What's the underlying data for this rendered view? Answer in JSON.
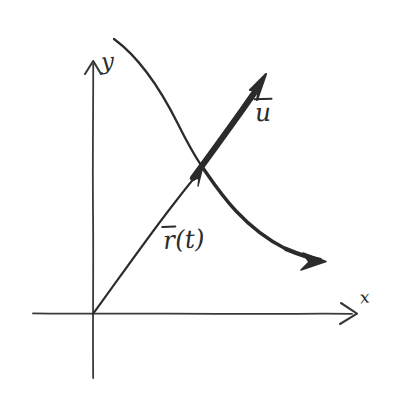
{
  "figure": {
    "kind": "hand-drawn-sketch",
    "background_color": "#ffffff",
    "ink_color": "#2b2b2b",
    "width": 395,
    "height": 402
  },
  "axes": {
    "x_label": "x",
    "y_label": "y",
    "origin": {
      "x": 93,
      "y": 314
    },
    "x_axis": {
      "start_x": 33,
      "end_x": 356,
      "y": 314,
      "arrow": "right"
    },
    "y_axis": {
      "x": 93,
      "start_y": 378,
      "end_y": 60,
      "arrow": "up"
    }
  },
  "vectors": [
    {
      "name": "position-vector",
      "label_r": "r",
      "label_paren": "(t)",
      "from": {
        "x": 93,
        "y": 314
      },
      "to": {
        "x": 201,
        "y": 169
      },
      "stroke_width": 2,
      "arrow": true,
      "label_position": {
        "x": 163,
        "y": 227
      }
    },
    {
      "name": "tangent-vector",
      "label_u": "u",
      "from": {
        "x": 194,
        "y": 176
      },
      "to": {
        "x": 266,
        "y": 77
      },
      "stroke_width": 6,
      "arrow": true,
      "label_position": {
        "x": 255,
        "y": 100
      }
    }
  ],
  "curve": {
    "name": "trajectory-curve",
    "start": {
      "x": 114,
      "y": 39
    },
    "end": {
      "x": 323,
      "y": 261
    },
    "passes_through": {
      "x": 203,
      "y": 168
    },
    "arrow_at_end": true,
    "stroke_width_start": 2,
    "stroke_width_end": 5
  }
}
